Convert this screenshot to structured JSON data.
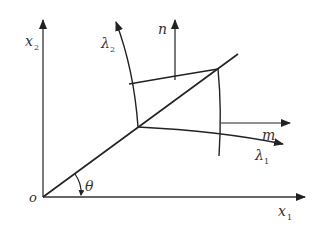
{
  "diagram": {
    "labels": {
      "origin": "o",
      "x1_axis": "x",
      "x1_sub": "1",
      "x2_axis": "x",
      "x2_sub": "2",
      "lambda1": "λ",
      "lambda1_sub": "1",
      "lambda2": "λ",
      "lambda2_sub": "2",
      "normal_n": "n",
      "normal_m": "m",
      "angle": "θ"
    },
    "colors": {
      "stroke": "#222222",
      "text": "#333333",
      "background": "#ffffff"
    }
  }
}
